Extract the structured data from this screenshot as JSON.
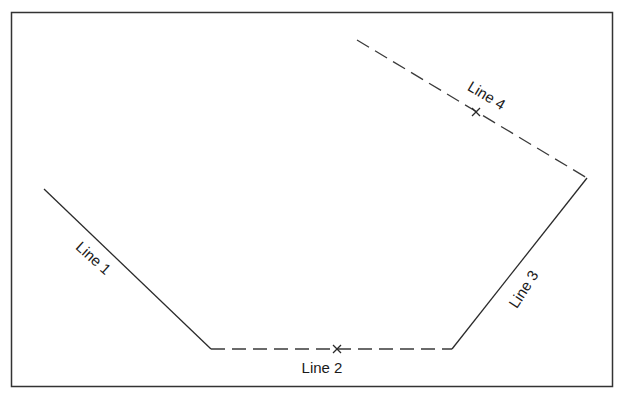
{
  "diagram": {
    "frame": {
      "x": 11,
      "y": 12,
      "width": 601,
      "height": 374,
      "stroke": "#333333"
    },
    "colors": {
      "line": "#2a2a2a",
      "dashed": "#3a3a3a",
      "text": "#1a1a1a"
    },
    "lines": [
      {
        "id": "line-1",
        "label": "Line 1",
        "style": "solid",
        "x1": 44,
        "y1": 189,
        "x2": 211,
        "y2": 349,
        "label_x": 90,
        "label_y": 262,
        "label_angle": 42,
        "marker": null
      },
      {
        "id": "line-2",
        "label": "Line 2",
        "style": "dashed",
        "x1": 211,
        "y1": 349,
        "x2": 452,
        "y2": 349,
        "label_x": 322,
        "label_y": 373,
        "label_angle": 0,
        "marker": {
          "x": 337,
          "y": 349
        }
      },
      {
        "id": "line-3",
        "label": "Line 3",
        "style": "solid",
        "x1": 452,
        "y1": 349,
        "x2": 587,
        "y2": 178,
        "label_x": 528,
        "label_y": 292,
        "label_angle": -57,
        "marker": null
      },
      {
        "id": "line-4",
        "label": "Line 4",
        "style": "dashed",
        "x1": 357,
        "y1": 40,
        "x2": 587,
        "y2": 178,
        "label_x": 484,
        "label_y": 100,
        "label_angle": 31,
        "marker": {
          "x": 476,
          "y": 112
        }
      }
    ]
  }
}
